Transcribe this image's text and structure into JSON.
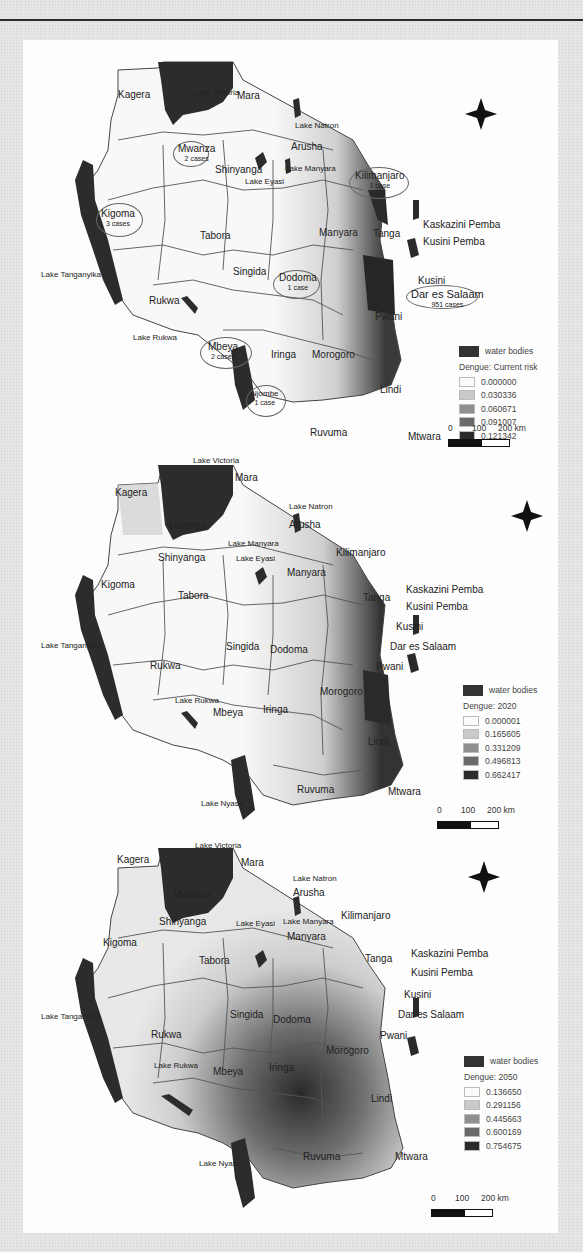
{
  "figure": {
    "panels": [
      {
        "id": "current",
        "legend": {
          "water_label": "water bodies",
          "title": "Dengue: Current risk",
          "classes": [
            {
              "value": "0.000000",
              "color": "#fbfbfb"
            },
            {
              "value": "0.030336",
              "color": "#c9c9c9"
            },
            {
              "value": "0.060671",
              "color": "#8f8f8f"
            },
            {
              "value": "0.091007",
              "color": "#6a6a6a"
            },
            {
              "value": "0.121342",
              "color": "#2b2b2b"
            }
          ]
        },
        "scale": {
          "t0": "0",
          "t1": "100",
          "t2": "200 km"
        },
        "regions": {
          "kagera": "Kagera",
          "mara": "Mara",
          "mwanza": "Mwanza",
          "arusha": "Arusha",
          "shinyanga": "Shinyanga",
          "kilimanjaro": "Kilimanjaro",
          "kigoma": "Kigoma",
          "tabora": "Tabora",
          "manyara": "Manyara",
          "tanga": "Tanga",
          "singida": "Singida",
          "dodoma": "Dodoma",
          "rukwa": "Rukwa",
          "mbeya": "Mbeya",
          "iringa": "Iringa",
          "morogoro": "Morogoro",
          "pwani": "Pwani",
          "lindi": "Lindi",
          "njombe": "Njombe",
          "ruvuma": "Ruvuma",
          "mtwara": "Mtwara",
          "dar": "Dar es Salaam",
          "kaskazini_pemba": "Kaskazini Pemba",
          "kusini_pemba": "Kusini Pemba",
          "kusini": "Kusini"
        },
        "lakes": {
          "victoria": "Lake Victoria",
          "natron": "Lake Natron",
          "manyara": "Lake Manyara",
          "eyasi": "Lake Eyasi",
          "tanganyika": "Lake Tanganyika",
          "rukwa": "Lake Rukwa",
          "nyasa": "Lake Nyasa"
        },
        "cases": {
          "mwanza": "2 cases",
          "kilimanjaro": "1 case",
          "kigoma": "3 cases",
          "dodoma": "1 case",
          "dar": "951 cases",
          "mbeya": "2 cases",
          "njombe": "1 case"
        }
      },
      {
        "id": "2020",
        "legend": {
          "water_label": "water bodies",
          "title": "Dengue: 2020",
          "classes": [
            {
              "value": "0.000001",
              "color": "#fbfbfb"
            },
            {
              "value": "0.165605",
              "color": "#c9c9c9"
            },
            {
              "value": "0.331209",
              "color": "#8f8f8f"
            },
            {
              "value": "0.496813",
              "color": "#6a6a6a"
            },
            {
              "value": "0.662417",
              "color": "#2b2b2b"
            }
          ]
        },
        "scale": {
          "t0": "0",
          "t1": "100",
          "t2": "200 km"
        },
        "regions": {
          "kagera": "Kagera",
          "mara": "Mara",
          "mwanza": "Mwanza",
          "arusha": "Arusha",
          "shinyanga": "Shinyanga",
          "kilimanjaro": "Kilimanjaro",
          "kigoma": "Kigoma",
          "tabora": "Tabora",
          "manyara": "Manyara",
          "tanga": "Tanga",
          "singida": "Singida",
          "dodoma": "Dodoma",
          "rukwa": "Rukwa",
          "mbeya": "Mbeya",
          "iringa": "Iringa",
          "morogoro": "Morogoro",
          "pwani": "Pwani",
          "lindi": "Lindi",
          "ruvuma": "Ruvuma",
          "mtwara": "Mtwara",
          "dar": "Dar es Salaam",
          "kaskazini_pemba": "Kaskazini Pemba",
          "kusini_pemba": "Kusini Pemba",
          "kusini": "Kusini"
        },
        "lakes": {
          "victoria": "Lake Victoria",
          "natron": "Lake Natron",
          "manyara": "Lake Manyara",
          "eyasi": "Lake Eyasi",
          "tanganyika": "Lake Tanganyika",
          "rukwa": "Lake Rukwa",
          "nyasa": "Lake Nyasa"
        }
      },
      {
        "id": "2050",
        "legend": {
          "water_label": "water bodies",
          "title": "Dengue: 2050",
          "classes": [
            {
              "value": "0.136650",
              "color": "#fbfbfb"
            },
            {
              "value": "0.291156",
              "color": "#c9c9c9"
            },
            {
              "value": "0.445663",
              "color": "#8f8f8f"
            },
            {
              "value": "0.600169",
              "color": "#6a6a6a"
            },
            {
              "value": "0.754675",
              "color": "#2b2b2b"
            }
          ]
        },
        "scale": {
          "t0": "0",
          "t1": "100",
          "t2": "200 km"
        },
        "regions": {
          "kagera": "Kagera",
          "mara": "Mara",
          "mwanza": "Mwanza",
          "arusha": "Arusha",
          "shinyanga": "Shinyanga",
          "kilimanjaro": "Kilimanjaro",
          "kigoma": "Kigoma",
          "tabora": "Tabora",
          "manyara": "Manyara",
          "tanga": "Tanga",
          "singida": "Singida",
          "dodoma": "Dodoma",
          "rukwa": "Rukwa",
          "mbeya": "Mbeya",
          "iringa": "Iringa",
          "morogoro": "Morogoro",
          "pwani": "Pwani",
          "lindi": "Lindi",
          "ruvuma": "Ruvuma",
          "mtwara": "Mtwara",
          "dar": "Dar es Salaam",
          "kaskazini_pemba": "Kaskazini Pemba",
          "kusini_pemba": "Kusini Pemba",
          "kusini": "Kusini"
        },
        "lakes": {
          "victoria": "Lake Victoria",
          "natron": "Lake Natron",
          "manyara": "Lake Manyara",
          "eyasi": "Lake Eyasi",
          "tanganyika": "Lake Tanganyika",
          "rukwa": "Lake Rukwa",
          "nyasa": "Lake Nyasa"
        }
      }
    ]
  }
}
